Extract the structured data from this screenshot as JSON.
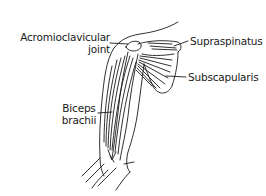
{
  "figure": {
    "labels": [
      {
        "id": "acromioclavicular",
        "line1": "Acromioclavicular",
        "line2": "joint"
      },
      {
        "id": "supraspinatus",
        "line1": "Supraspinatus"
      },
      {
        "id": "subscapularis",
        "line1": "Subscapularis"
      },
      {
        "id": "biceps",
        "line1": "Biceps",
        "line2": "brachii"
      }
    ],
    "colors": {
      "ink": "#1a1a1a",
      "background": "#ffffff"
    }
  }
}
